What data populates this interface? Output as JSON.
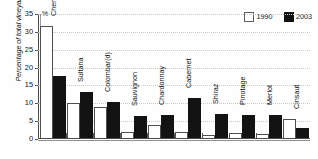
{
  "chart_data": {
    "type": "bar",
    "title": "",
    "xlabel": "",
    "ylabel": "Percentage of total vineyard area",
    "unit_marker": "%",
    "ylim": [
      0,
      35
    ],
    "yticks": [
      0,
      5,
      10,
      15,
      20,
      25,
      30,
      35
    ],
    "grid": true,
    "legend_position": "top-right",
    "categories": [
      "Chenin",
      "Sultana",
      "Colombar(d)",
      "Sauvignon",
      "Chardonnay",
      "Cabernet",
      "Shiraz",
      "Pinotage",
      "Merlot",
      "Cinsaut"
    ],
    "series": [
      {
        "name": "1990",
        "color": "#ffffff",
        "values": [
          31,
          9.5,
          8.3,
          1.5,
          3.3,
          1.5,
          0.6,
          1,
          0.8,
          5
        ]
      },
      {
        "name": "2003",
        "color": "#131313",
        "values": [
          17,
          12.5,
          9.7,
          5.8,
          6.3,
          11,
          6.5,
          6.3,
          6.2,
          2.5
        ]
      }
    ]
  },
  "legend": {
    "items": [
      {
        "label": "1990",
        "swatch": "white-square-swatch"
      },
      {
        "label": "2003",
        "swatch": "black-square-swatch"
      }
    ]
  },
  "axis": {
    "y_title": "Percentage of total vineyard area",
    "percent_symbol": "%",
    "tick_labels": [
      "35",
      "30",
      "25",
      "20",
      "15",
      "10",
      "5",
      "0"
    ]
  }
}
